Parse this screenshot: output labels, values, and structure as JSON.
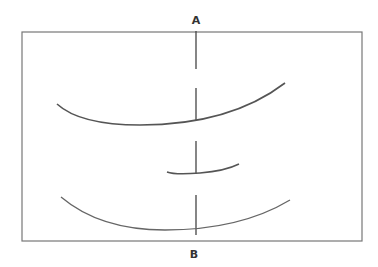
{
  "labels": {
    "top": "A",
    "bottom": "B"
  },
  "colors": {
    "stroke": "#555555",
    "background": "#ffffff"
  },
  "diagram": {
    "frame": {
      "x": 22,
      "y": 32,
      "width": 340,
      "height": 209
    },
    "axis_line": {
      "x": 196,
      "from_label": "A",
      "to_label": "B",
      "style": "dashed"
    },
    "curves": [
      {
        "name": "upper-curve",
        "from": [
          57,
          104
        ],
        "via": [
          135,
          135
        ],
        "to": [
          285,
          83
        ]
      },
      {
        "name": "middle-curve",
        "from": [
          167,
          172
        ],
        "via": [
          200,
          175
        ],
        "to": [
          239,
          164
        ]
      },
      {
        "name": "lower-curve",
        "from": [
          61,
          197
        ],
        "via": [
          170,
          250
        ],
        "to": [
          290,
          200
        ]
      }
    ]
  }
}
